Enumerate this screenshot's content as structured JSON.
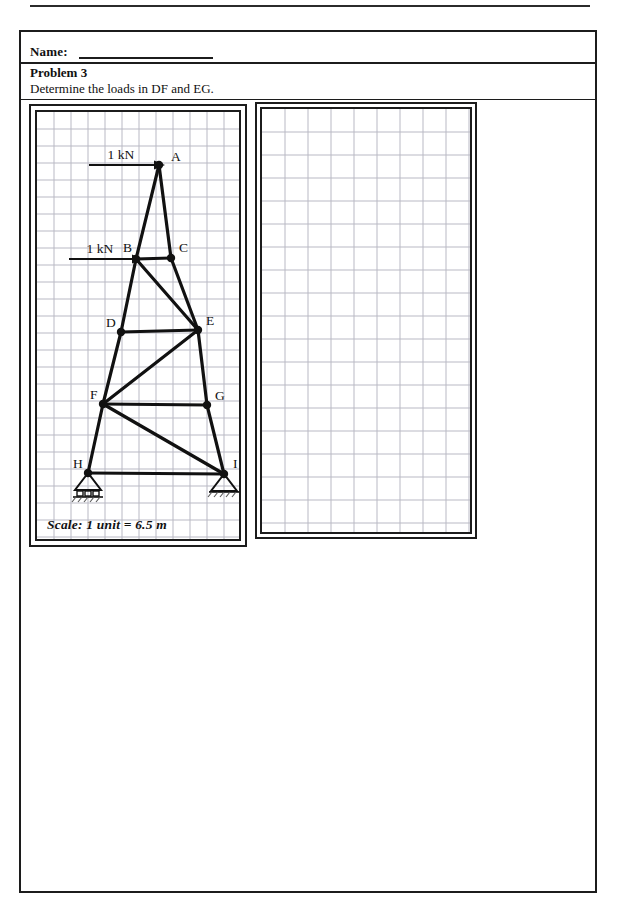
{
  "header": {
    "name_label": "Name:",
    "problem_title": "Problem 3",
    "problem_statement": "Determine the loads in DF and EG."
  },
  "figure": {
    "scale_note": "Scale: 1 unit = 6.5 m",
    "grid": {
      "columns": 11,
      "rows": 22,
      "cell_px": 17,
      "color": "#b9b9c4"
    },
    "loads": [
      {
        "id": "load-top",
        "label": "1 kN",
        "applied_to": "A",
        "direction": "right",
        "x1": 52,
        "x2": 119,
        "y": 53
      },
      {
        "id": "load-mid",
        "label": "1 kN",
        "applied_to": "B",
        "direction": "right",
        "x1": 32,
        "x2": 97,
        "y": 147
      }
    ],
    "nodes": [
      {
        "id": "A",
        "x": 122,
        "y": 53,
        "label": "A",
        "lx": 134,
        "ly": 49
      },
      {
        "id": "B",
        "x": 99,
        "y": 147,
        "label": "B",
        "lx": 86,
        "ly": 140
      },
      {
        "id": "C",
        "x": 134,
        "y": 146,
        "label": "C",
        "lx": 142,
        "ly": 140
      },
      {
        "id": "D",
        "x": 84,
        "y": 220,
        "label": "D",
        "lx": 69,
        "ly": 215
      },
      {
        "id": "E",
        "x": 161,
        "y": 218,
        "label": "E",
        "lx": 169,
        "ly": 213
      },
      {
        "id": "F",
        "x": 66,
        "y": 292,
        "label": "F",
        "lx": 53,
        "ly": 287
      },
      {
        "id": "G",
        "x": 170,
        "y": 293,
        "label": "G",
        "lx": 178,
        "ly": 288
      },
      {
        "id": "H",
        "x": 51,
        "y": 361,
        "label": "H",
        "lx": 36,
        "ly": 356
      },
      {
        "id": "I",
        "x": 187,
        "y": 362,
        "label": "I",
        "lx": 196,
        "ly": 356
      }
    ],
    "members": [
      [
        "A",
        "B"
      ],
      [
        "A",
        "C"
      ],
      [
        "B",
        "C"
      ],
      [
        "B",
        "D"
      ],
      [
        "B",
        "E"
      ],
      [
        "C",
        "E"
      ],
      [
        "D",
        "E"
      ],
      [
        "D",
        "F"
      ],
      [
        "E",
        "F"
      ],
      [
        "E",
        "G"
      ],
      [
        "F",
        "G"
      ],
      [
        "F",
        "H"
      ],
      [
        "F",
        "I"
      ],
      [
        "G",
        "I"
      ],
      [
        "H",
        "I"
      ]
    ],
    "supports": [
      {
        "id": "support-H",
        "node": "H",
        "type": "roller"
      },
      {
        "id": "support-I",
        "node": "I",
        "type": "pin"
      }
    ]
  },
  "work_area": {
    "grid": {
      "columns": 9,
      "rows": 18,
      "cell_px": 23,
      "color": "#b9b9c4"
    }
  }
}
